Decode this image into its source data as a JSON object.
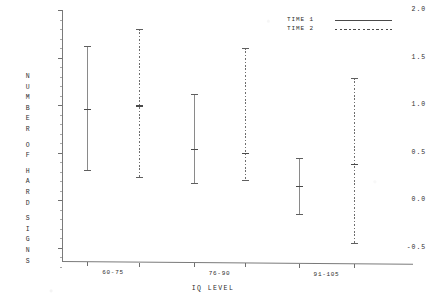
{
  "chart_data": {
    "type": "scatter",
    "title": "",
    "xlabel": "IQ LEVEL",
    "ylabel": "NUMBER OF HARD SIGNS",
    "ylim": [
      -0.75,
      2.0
    ],
    "yticks": [
      2.0,
      1.5,
      1.0,
      0.5,
      0.0,
      -0.5
    ],
    "ytick_labels": [
      "2.0",
      "1.5",
      "1.0",
      "0.5",
      "0.0",
      "-0.5"
    ],
    "grid": false,
    "legend_position": "top-right",
    "categories": [
      "60-75",
      "76-90",
      "91-105"
    ],
    "series": [
      {
        "name": "TIME 1",
        "style": "solid",
        "values": [
          0.96,
          0.54,
          0.15
        ],
        "upper": [
          1.62,
          1.12,
          0.44
        ],
        "lower": [
          0.3,
          0.17,
          -0.16
        ]
      },
      {
        "name": "TIME 2",
        "style": "dashed",
        "values": [
          1.0,
          0.5,
          0.38
        ],
        "upper": [
          1.8,
          1.6,
          1.28
        ],
        "lower": [
          0.23,
          0.2,
          -0.46
        ]
      }
    ],
    "points": [
      {
        "group": "60-75",
        "series": "TIME 1",
        "mean": 0.96,
        "upper": 1.62,
        "lower": 0.3
      },
      {
        "group": "60-75",
        "series": "TIME 2",
        "mean": 1.0,
        "upper": 1.8,
        "lower": 0.23
      },
      {
        "group": "76-90",
        "series": "TIME 1",
        "mean": 0.54,
        "upper": 1.12,
        "lower": 0.17
      },
      {
        "group": "76-90",
        "series": "TIME 2",
        "mean": 0.5,
        "upper": 1.6,
        "lower": 0.2
      },
      {
        "group": "91-105",
        "series": "TIME 1",
        "mean": 0.15,
        "upper": 0.44,
        "lower": -0.16
      },
      {
        "group": "91-105",
        "series": "TIME 2",
        "mean": 0.38,
        "upper": 1.28,
        "lower": -0.46
      }
    ]
  },
  "axes": {
    "y_title_chars": [
      "N",
      "U",
      "M",
      "B",
      "E",
      "R",
      "",
      "O",
      "F",
      "",
      "H",
      "A",
      "R",
      "D",
      "",
      "S",
      "I",
      "G",
      "N",
      "S"
    ],
    "x_title": "IQ LEVEL",
    "x_labels": [
      "60-75",
      "76-90",
      "91-105"
    ]
  },
  "legend": {
    "items": [
      {
        "label": "TIME 1",
        "style": "solid"
      },
      {
        "label": "TIME 2",
        "style": "dashed"
      }
    ]
  }
}
